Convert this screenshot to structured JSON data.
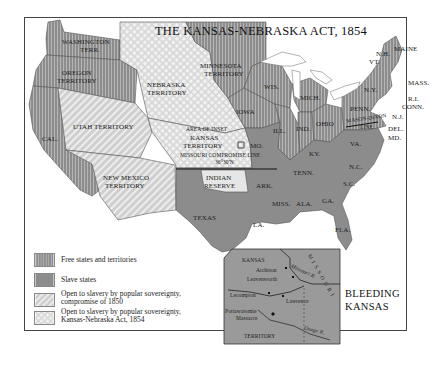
{
  "title": "THE KANSAS-NEBRASKA ACT, 1854",
  "colors": {
    "free": "#8f8f8f",
    "slave": "#8a8a8a",
    "compromise_1850": "#d4d4d4",
    "kansas_nebraska": "#e2e2e2",
    "water": "#ffffff",
    "border": "#555555"
  },
  "regions": {
    "washington": "WASHINGTON",
    "washington2": "TERR.",
    "oregon": "OREGON",
    "oregon2": "TERRITORY",
    "cal": "CAL.",
    "utah": "UTAH TERRITORY",
    "new_mexico": "NEW MEXICO",
    "new_mexico2": "TERRITORY",
    "nebraska": "NEBRASKA",
    "nebraska2": "TERRITORY",
    "minnesota": "MINNESOTA",
    "minnesota2": "TERRITORY",
    "kansas": "KANSAS",
    "kansas2": "TERRITORY",
    "area_of_inset": "AREA OF INSET",
    "missouri_line": "MISSOURI COMPROMISE LINE",
    "missouri_line_lat": "36°30'N",
    "indian": "INDIAN",
    "indian2": "RESERVE",
    "texas": "TEXAS",
    "iowa": "IOWA",
    "wis": "WIS.",
    "mich": "MICH.",
    "ill": "ILL.",
    "ind": "IND.",
    "ohio": "OHIO",
    "mo": "MO.",
    "ky": "KY.",
    "tenn": "TENN.",
    "ark": "ARK.",
    "la": "LA.",
    "miss": "MISS.",
    "ala": "ALA.",
    "ga": "GA.",
    "fla": "FLA.",
    "sc": "S.C.",
    "nc": "N.C.",
    "va": "VA.",
    "penn": "PENN.",
    "ny": "N.Y.",
    "maine": "MAINE",
    "nh": "N.H.",
    "vt": "VT.",
    "mass": "MASS.",
    "ri": "R.I.",
    "conn": "CONN.",
    "nj": "N.J.",
    "del": "DEL.",
    "md": "MD.",
    "mason_dixon": "MASON-DIXON",
    "mason_dixon2": "LINE"
  },
  "legend": [
    {
      "label": "Free states and territories",
      "pattern": "free"
    },
    {
      "label": "Slave states",
      "pattern": "slave"
    },
    {
      "label": "Open to slavery by popular sovereignty,",
      "label2": "compromise of 1850",
      "pattern": "compromise_1850"
    },
    {
      "label": "Open to slavery by popular sovereignty,",
      "label2": "Kansas-Nebraska Act, 1854",
      "pattern": "kansas_nebraska"
    }
  ],
  "inset": {
    "title_line1": "BLEEDING",
    "title_line2": "KANSAS",
    "kansas": "KANSAS",
    "territory": "TERRITORY",
    "missouri": "MISSOURI",
    "places": [
      "Atchison",
      "Leavenworth",
      "Lecompton",
      "Lawrence",
      "Pottawatomie",
      "Massacre"
    ],
    "rivers": [
      "Missouri R.",
      "Osage R."
    ]
  }
}
